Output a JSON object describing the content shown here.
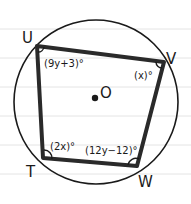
{
  "diagram": {
    "center_label": "O",
    "vertices": [
      {
        "name": "U",
        "label": "U"
      },
      {
        "name": "V",
        "label": "V"
      },
      {
        "name": "W",
        "label": "W"
      },
      {
        "name": "T",
        "label": "T"
      }
    ],
    "angles": {
      "U": "(9y+3)°",
      "V": "(x)°",
      "T": "(2x)°",
      "W": "(12y−12)°"
    },
    "colors": {
      "stroke": "#1a1a1a",
      "ruled_line": "#e4e4e4",
      "background": "#ffffff"
    }
  }
}
